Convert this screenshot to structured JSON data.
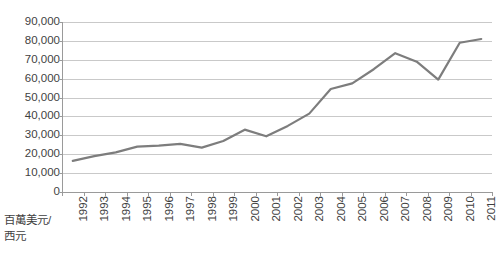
{
  "chart_data": {
    "type": "line",
    "title": "",
    "xlabel": "西元",
    "ylabel": "百萬美元",
    "axis_title_line1": "百萬美元/",
    "axis_title_line2": "西元",
    "categories": [
      "1992",
      "1993",
      "1994",
      "1995",
      "1996",
      "1997",
      "1998",
      "1999",
      "2000",
      "2001",
      "2002",
      "2003",
      "2004",
      "2005",
      "2006",
      "2007",
      "2008",
      "2009",
      "2010",
      "2011"
    ],
    "values": [
      16500,
      19000,
      21000,
      24000,
      24500,
      25500,
      23500,
      27000,
      33000,
      29500,
      35000,
      41500,
      54500,
      57500,
      65000,
      73500,
      69000,
      59500,
      79000,
      81000
    ],
    "ylim": [
      0,
      90000
    ],
    "yticks": [
      0,
      10000,
      20000,
      30000,
      40000,
      50000,
      60000,
      70000,
      80000,
      90000
    ],
    "ytick_labels": [
      "0",
      "10,000",
      "20,000",
      "30,000",
      "40,000",
      "50,000",
      "60,000",
      "70,000",
      "80,000",
      "90,000"
    ],
    "grid": true,
    "legend": false,
    "series_color": "#7d7d7d",
    "grid_color": "#c9c9c9",
    "axis_color": "#9a9a9a",
    "background_color": "#ffffff",
    "series": [
      {
        "name": "value",
        "values": [
          16500,
          19000,
          21000,
          24000,
          24500,
          25500,
          23500,
          27000,
          33000,
          29500,
          35000,
          41500,
          54500,
          57500,
          65000,
          73500,
          69000,
          59500,
          79000,
          81000
        ]
      }
    ]
  }
}
